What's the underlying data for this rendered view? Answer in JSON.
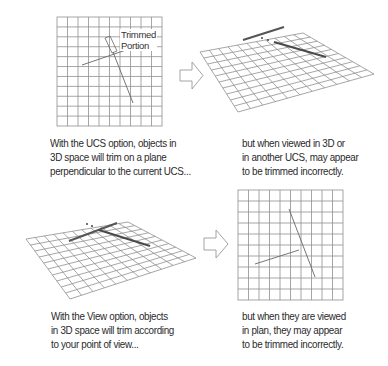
{
  "panels": [
    {
      "id": "ucs-plan",
      "view": "plan",
      "label": {
        "line1": "Trimmed",
        "line2": "Portion"
      },
      "caption": [
        "With the UCS option, objects in",
        "3D space will trim on a plane",
        "perpendicular to the current UCS..."
      ]
    },
    {
      "id": "ucs-3d",
      "view": "3d",
      "caption": [
        "but when viewed in 3D or",
        "in another UCS, may appear",
        "to be trimmed incorrectly."
      ]
    },
    {
      "id": "view-3d",
      "view": "3d",
      "caption": [
        "With the View option, objects",
        "in 3D space will trim according",
        "to your point of view..."
      ]
    },
    {
      "id": "view-plan",
      "view": "plan",
      "caption": [
        "but when they are viewed",
        "in plan, they may appear",
        "to be trimmed incorrectly."
      ]
    }
  ],
  "arrows": [
    {
      "id": "arrow-top",
      "icon": "right-arrow-icon"
    },
    {
      "id": "arrow-bottom",
      "icon": "right-arrow-icon"
    }
  ],
  "colors": {
    "grid": "#8a8a8a",
    "line": "#555555",
    "thick_line": "#4a4a4a",
    "text": "#2b2b2b"
  }
}
